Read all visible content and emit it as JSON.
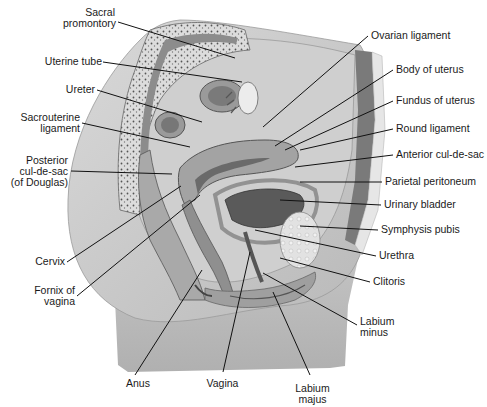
{
  "diagram": {
    "colors": {
      "background": "#ffffff",
      "skin": "#c9c9c9",
      "skin_dark": "#a8a8a8",
      "bone": "#d8d8d8",
      "organ": "#b5b5b5",
      "organ_dark": "#6e6e6e",
      "leader_line": "#111111",
      "text": "#1a1a1a"
    },
    "labels_left": [
      {
        "id": "sacral-promontory",
        "text": "Sacral\npromontory"
      },
      {
        "id": "uterine-tube",
        "text": "Uterine tube"
      },
      {
        "id": "ureter",
        "text": "Ureter"
      },
      {
        "id": "sacrouterine-ligament",
        "text": "Sacrouterine\nligament"
      },
      {
        "id": "posterior-cul-de-sac",
        "text": "Posterior\ncul-de-sac\n(of Douglas)"
      },
      {
        "id": "cervix",
        "text": "Cervix"
      },
      {
        "id": "fornix-of-vagina",
        "text": "Fornix of\nvagina"
      }
    ],
    "labels_right": [
      {
        "id": "ovarian-ligament",
        "text": "Ovarian ligament"
      },
      {
        "id": "body-of-uterus",
        "text": "Body of uterus"
      },
      {
        "id": "fundus-of-uterus",
        "text": "Fundus of uterus"
      },
      {
        "id": "round-ligament",
        "text": "Round ligament"
      },
      {
        "id": "anterior-cul-de-sac",
        "text": "Anterior cul-de-sac"
      },
      {
        "id": "parietal-peritoneum",
        "text": "Parietal peritoneum"
      },
      {
        "id": "urinary-bladder",
        "text": "Urinary bladder"
      },
      {
        "id": "symphysis-pubis",
        "text": "Symphysis pubis"
      },
      {
        "id": "urethra",
        "text": "Urethra"
      },
      {
        "id": "clitoris",
        "text": "Clitoris"
      },
      {
        "id": "labium-minus",
        "text": "Labium\nminus"
      }
    ],
    "labels_bottom": [
      {
        "id": "anus",
        "text": "Anus"
      },
      {
        "id": "vagina",
        "text": "Vagina"
      },
      {
        "id": "labium-majus",
        "text": "Labium\nmajus"
      }
    ]
  }
}
